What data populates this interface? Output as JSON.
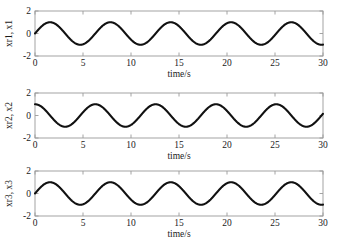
{
  "figure": {
    "background_color": "#ffffff",
    "curve_color": "#111111",
    "axis_color": "#9a9a9a",
    "text_color": "#1a1a1a"
  },
  "chart_data": [
    {
      "type": "line",
      "title": "",
      "xlabel": "time/s",
      "ylabel": "xr1, x1",
      "xlim": [
        0,
        30
      ],
      "ylim": [
        -2,
        2
      ],
      "xticks": [
        0,
        5,
        10,
        15,
        20,
        25,
        30
      ],
      "xtick_labels": [
        "0",
        "5",
        "10",
        "15",
        "20",
        "25",
        "30"
      ],
      "yticks": [
        -2,
        0,
        2
      ],
      "ytick_labels": [
        "-2",
        "0",
        "2"
      ],
      "grid": false,
      "legend": false,
      "series": [
        {
          "name": "xr1, x1",
          "waveform": "sine",
          "amplitude": 1.0,
          "omega": 1.0,
          "phase": 0.0,
          "offset": 0.0,
          "x": [
            0,
            1.57,
            3.14,
            4.71,
            6.28,
            7.85,
            9.42,
            11.0,
            12.57,
            14.14,
            15.71,
            17.28,
            18.85,
            20.42,
            21.99,
            23.56,
            25.13,
            26.7,
            28.27,
            30.0
          ],
          "values": [
            0.0,
            1.0,
            0.0,
            -1.0,
            0.0,
            1.0,
            0.0,
            -1.0,
            0.0,
            1.0,
            0.0,
            -1.0,
            0.0,
            1.0,
            0.0,
            -1.0,
            0.0,
            1.0,
            0.0,
            -0.99
          ]
        }
      ]
    },
    {
      "type": "line",
      "title": "",
      "xlabel": "time/s",
      "ylabel": "xr2, x2",
      "xlim": [
        0,
        30
      ],
      "ylim": [
        -2,
        2
      ],
      "xticks": [
        0,
        5,
        10,
        15,
        20,
        25,
        30
      ],
      "xtick_labels": [
        "0",
        "5",
        "10",
        "15",
        "20",
        "25",
        "30"
      ],
      "yticks": [
        -2,
        0,
        2
      ],
      "ytick_labels": [
        "-2",
        "0",
        "2"
      ],
      "grid": false,
      "legend": false,
      "series": [
        {
          "name": "xr2, x2",
          "waveform": "cosine",
          "amplitude": 1.0,
          "omega": 1.0,
          "phase": 1.5708,
          "offset": 0.0,
          "x": [
            0,
            1.57,
            3.14,
            4.71,
            6.28,
            7.85,
            9.42,
            11.0,
            12.57,
            14.14,
            15.71,
            17.28,
            18.85,
            20.42,
            21.99,
            23.56,
            25.13,
            26.7,
            28.27,
            30.0
          ],
          "values": [
            1.0,
            0.0,
            -1.0,
            0.0,
            1.0,
            0.0,
            -1.0,
            0.0,
            1.0,
            0.0,
            -1.0,
            0.0,
            1.0,
            0.0,
            -1.0,
            0.0,
            1.0,
            0.0,
            -1.0,
            -0.15
          ]
        }
      ]
    },
    {
      "type": "line",
      "title": "",
      "xlabel": "time/s",
      "ylabel": "xr3, x3",
      "xlim": [
        0,
        30
      ],
      "ylim": [
        -2,
        2
      ],
      "xticks": [
        0,
        5,
        10,
        15,
        20,
        25,
        30
      ],
      "xtick_labels": [
        "0",
        "5",
        "10",
        "15",
        "20",
        "25",
        "30"
      ],
      "yticks": [
        -2,
        0,
        2
      ],
      "ytick_labels": [
        "-2",
        "0",
        "2"
      ],
      "grid": false,
      "legend": false,
      "series": [
        {
          "name": "xr3, x3",
          "waveform": "sine",
          "amplitude": 1.0,
          "omega": 1.0,
          "phase": 0.0,
          "offset": 0.0,
          "x": [
            0,
            1.57,
            3.14,
            4.71,
            6.28,
            7.85,
            9.42,
            11.0,
            12.57,
            14.14,
            15.71,
            17.28,
            18.85,
            20.42,
            21.99,
            23.56,
            25.13,
            26.7,
            28.27,
            30.0
          ],
          "values": [
            0.0,
            1.0,
            0.0,
            -1.0,
            0.0,
            1.0,
            0.0,
            -1.0,
            0.0,
            1.0,
            0.0,
            -1.0,
            0.0,
            1.0,
            0.0,
            -1.0,
            0.0,
            1.0,
            0.0,
            -0.99
          ]
        }
      ]
    }
  ]
}
